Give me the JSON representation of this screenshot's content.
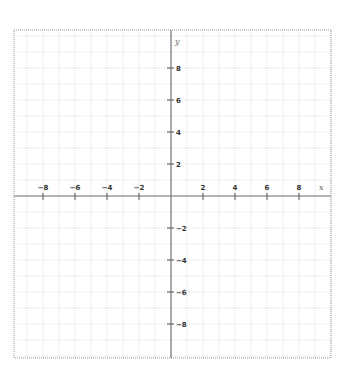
{
  "diagram": {
    "type": "coordinate-plane",
    "axes": {
      "x_label": "x",
      "y_label": "y",
      "x_ticks": [
        {
          "value": -8,
          "label": "−8"
        },
        {
          "value": -6,
          "label": "−6"
        },
        {
          "value": -4,
          "label": "−4"
        },
        {
          "value": -2,
          "label": "−2"
        },
        {
          "value": 2,
          "label": "2"
        },
        {
          "value": 4,
          "label": "4"
        },
        {
          "value": 6,
          "label": "6"
        },
        {
          "value": 8,
          "label": "8"
        }
      ],
      "y_ticks": [
        {
          "value": 8,
          "label": "8"
        },
        {
          "value": 6,
          "label": "6"
        },
        {
          "value": 4,
          "label": "4"
        },
        {
          "value": 2,
          "label": "2"
        },
        {
          "value": -2,
          "label": "−2"
        },
        {
          "value": -4,
          "label": "−4"
        },
        {
          "value": -6,
          "label": "−6"
        },
        {
          "value": -8,
          "label": "−8"
        }
      ]
    },
    "grid": {
      "on": true,
      "unit_px": 16,
      "style": "dotted",
      "color": "#bbbbbb"
    },
    "colors": {
      "axis": "#777777",
      "border": "#999999",
      "label": "#333333"
    }
  }
}
